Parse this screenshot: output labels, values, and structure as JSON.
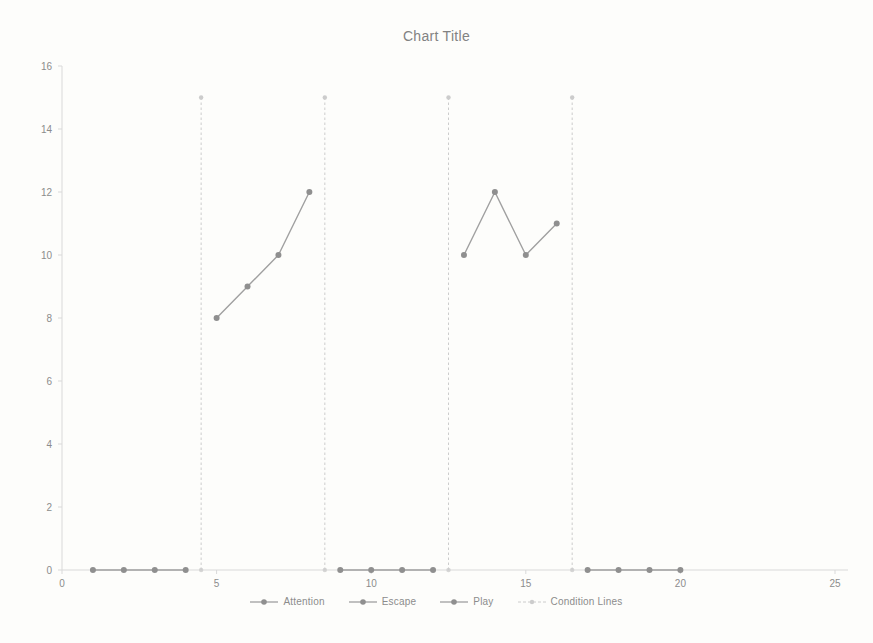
{
  "chart_data": {
    "type": "line",
    "title": "Chart Title",
    "xlabel": "",
    "ylabel": "",
    "xlim": [
      0,
      25
    ],
    "ylim": [
      0,
      16
    ],
    "x_ticks": [
      0,
      5,
      10,
      15,
      20,
      25
    ],
    "y_ticks": [
      0,
      2,
      4,
      6,
      8,
      10,
      12,
      14,
      16
    ],
    "grid": "off",
    "legend_position": "bottom",
    "series": [
      {
        "name": "Attention",
        "segments": [
          [
            [
              5,
              8
            ],
            [
              6,
              9
            ],
            [
              7,
              10
            ],
            [
              8,
              12
            ]
          ]
        ]
      },
      {
        "name": "Escape",
        "segments": [
          [
            [
              13,
              10
            ],
            [
              14,
              12
            ],
            [
              15,
              10
            ],
            [
              16,
              11
            ]
          ]
        ]
      },
      {
        "name": "Play",
        "segments": [
          [
            [
              1,
              0
            ],
            [
              2,
              0
            ],
            [
              3,
              0
            ],
            [
              4,
              0
            ]
          ],
          [
            [
              9,
              0
            ],
            [
              10,
              0
            ],
            [
              11,
              0
            ],
            [
              12,
              0
            ]
          ],
          [
            [
              17,
              0
            ],
            [
              18,
              0
            ],
            [
              19,
              0
            ],
            [
              20,
              0
            ]
          ]
        ]
      }
    ],
    "condition_lines": {
      "name": "Condition Lines",
      "x_positions": [
        4.5,
        8.5,
        12.5,
        16.5
      ],
      "y_range": [
        0,
        15
      ],
      "style": "dashed"
    },
    "colors": {
      "series_line": "#a0a0a0",
      "series_marker": "#8f8f8f",
      "condition_line": "#cccccc",
      "axis_line": "#d9d9d9",
      "tick_text": "#8c8c8c",
      "title_text": "#828282",
      "background": "#fdfdfb"
    }
  }
}
